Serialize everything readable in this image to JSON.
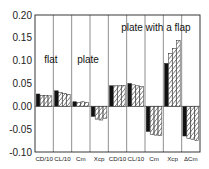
{
  "chart_data": {
    "type": "bar",
    "title": "",
    "xlabel": "",
    "ylabel": "",
    "ylim": [
      -0.1,
      0.2
    ],
    "yticks": [
      "0.20",
      "0.15",
      "0.10",
      "0.05",
      "0.00",
      "-0.05",
      "-0.10"
    ],
    "grid": "vertical separators between categories",
    "legend": null,
    "categories": [
      "CD/10",
      "CL/10",
      "Cm",
      "Xcp",
      "CD/10",
      "CL/10",
      "Cm",
      "Xcp",
      "ΔCm"
    ],
    "groups": [
      {
        "label": "flat plate",
        "categories": [
          "CD/10",
          "CL/10",
          "Cm",
          "Xcp"
        ]
      },
      {
        "label": "plate with a flap",
        "categories": [
          "CD/10",
          "CL/10",
          "Cm",
          "Xcp",
          "ΔCm"
        ]
      }
    ],
    "series": [
      {
        "name": "series 1 (solid black)",
        "fill": "#111111",
        "values": [
          0.027,
          0.034,
          0.01,
          -0.022,
          0.045,
          0.05,
          -0.055,
          0.094,
          -0.065
        ]
      },
      {
        "name": "series 2 (hatched)",
        "fill": "hatch",
        "values": [
          0.024,
          0.03,
          0.008,
          -0.028,
          0.045,
          0.047,
          -0.062,
          0.116,
          -0.07
        ]
      },
      {
        "name": "series 3 (hatched)",
        "fill": "hatch",
        "values": [
          0.024,
          0.028,
          0.01,
          -0.03,
          0.045,
          0.045,
          -0.063,
          0.127,
          -0.072
        ]
      },
      {
        "name": "series 4 (hatched)",
        "fill": "hatch",
        "values": [
          0.023,
          0.026,
          0.009,
          -0.026,
          0.046,
          0.043,
          -0.064,
          0.144,
          -0.075
        ]
      }
    ],
    "annotations": [
      {
        "text": "flat",
        "x_group": 0.5,
        "y": 0.095
      },
      {
        "text": "plate",
        "x_group": 2.3,
        "y": 0.095
      },
      {
        "text": "plate with a flap",
        "x_group": 4.7,
        "y": 0.165
      }
    ]
  }
}
